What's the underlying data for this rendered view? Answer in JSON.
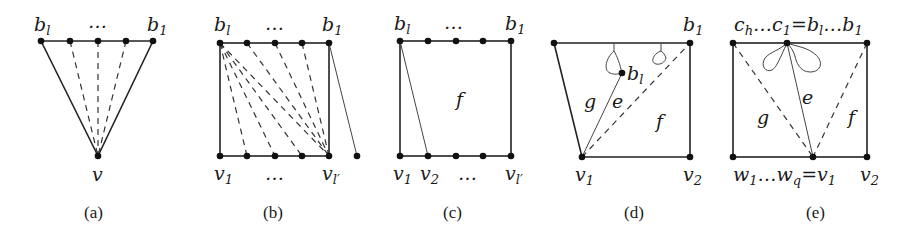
{
  "figure": {
    "panels": [
      {
        "id": "a",
        "caption": "(a)",
        "labels": {
          "top_left": "b",
          "top_left_sub": "l",
          "top_dots": "…",
          "top_right": "b",
          "top_right_sub": "1",
          "apex": "v"
        }
      },
      {
        "id": "b",
        "caption": "(b)",
        "labels": {
          "top_left": "b",
          "top_left_sub": "l",
          "top_dots": "…",
          "top_right": "b",
          "top_right_sub": "1",
          "bottom_left": "v",
          "bottom_left_sub": "1",
          "bottom_dots": "…",
          "bottom_right": "v",
          "bottom_right_sub": "l′"
        }
      },
      {
        "id": "c",
        "caption": "(c)",
        "labels": {
          "top_left": "b",
          "top_left_sub": "l",
          "top_dots": "…",
          "top_right": "b",
          "top_right_sub": "1",
          "bottom_1": "v",
          "bottom_1_sub": "1",
          "bottom_2": "v",
          "bottom_2_sub": "2",
          "bottom_dots": "…",
          "bottom_right": "v",
          "bottom_right_sub": "l′",
          "face": "f"
        }
      },
      {
        "id": "d",
        "caption": "(d)",
        "labels": {
          "top_right": "b",
          "top_right_sub": "1",
          "inner": "b",
          "inner_sub": "l",
          "bottom_left": "v",
          "bottom_left_sub": "1",
          "bottom_right": "v",
          "bottom_right_sub": "2",
          "face_g": "g",
          "edge_e": "e",
          "face_f": "f"
        }
      },
      {
        "id": "e",
        "caption": "(e)",
        "labels": {
          "top_left": "c",
          "top_left_sub": "h",
          "top_mid": "…c",
          "top_mid_sub": "1",
          "top_eq": "=b",
          "top_eq_sub": "l",
          "top_right": "…b",
          "top_right_sub": "1",
          "bottom_left": "w",
          "bottom_left_sub": "1",
          "bottom_mid": "…w",
          "bottom_mid_sub": "q",
          "bottom_eq": "=v",
          "bottom_eq_sub": "1",
          "bottom_right": "v",
          "bottom_right_sub": "2",
          "face_g": "g",
          "edge_e": "e",
          "face_f": "f"
        }
      }
    ]
  }
}
